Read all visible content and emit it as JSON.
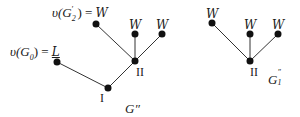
{
  "diagrams": [
    {
      "id": "G''",
      "caption": "G''",
      "nodes": [
        {
          "key": "g0",
          "x": 57,
          "y": 62,
          "label": "v(G0) = L"
        },
        {
          "key": "I",
          "x": 108,
          "y": 88,
          "label": "I"
        },
        {
          "key": "II",
          "x": 135,
          "y": 61,
          "label": "II"
        },
        {
          "key": "g2",
          "x": 96,
          "y": 24,
          "label": "v(G2') = W"
        },
        {
          "key": "w1",
          "x": 135,
          "y": 34,
          "label": "W"
        },
        {
          "key": "w2",
          "x": 162,
          "y": 34,
          "label": "W"
        }
      ],
      "edges": [
        [
          "g0",
          "I"
        ],
        [
          "I",
          "II"
        ],
        [
          "II",
          "g2"
        ],
        [
          "II",
          "w1"
        ],
        [
          "II",
          "w2"
        ]
      ]
    },
    {
      "id": "G1''",
      "caption": "G1''",
      "nodes": [
        {
          "key": "a",
          "x": 212,
          "y": 23,
          "label": "W"
        },
        {
          "key": "b",
          "x": 250,
          "y": 34,
          "label": "W"
        },
        {
          "key": "c",
          "x": 278,
          "y": 34,
          "label": "W"
        },
        {
          "key": "II",
          "x": 250,
          "y": 61,
          "label": "II"
        }
      ],
      "edges": [
        [
          "II",
          "a"
        ],
        [
          "II",
          "b"
        ],
        [
          "II",
          "c"
        ]
      ]
    }
  ],
  "labels": {
    "g0_prefix": "υ(G",
    "g0_sub": "0",
    "g0_suffix": ") = ",
    "g0_value": "L",
    "g2_prefix": "υ(G",
    "g2_sub": "2",
    "g2_prime": "′",
    "g2_suffix": ") = ",
    "g2_value": "W",
    "w": "W",
    "node_I": "I",
    "node_II": "II",
    "caption_left": "G″",
    "caption_right_main": "G",
    "caption_right_sup": "″",
    "caption_right_sub": "1"
  }
}
